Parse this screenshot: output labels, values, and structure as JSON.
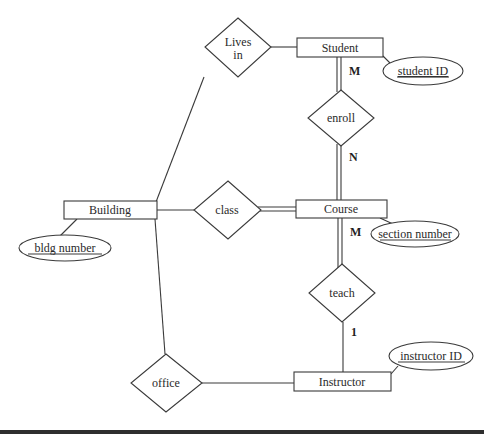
{
  "diagram": {
    "type": "ER diagram",
    "entities": [
      {
        "id": "student",
        "label": "Student"
      },
      {
        "id": "building",
        "label": "Building"
      },
      {
        "id": "course",
        "label": "Course"
      },
      {
        "id": "instructor",
        "label": "Instructor"
      }
    ],
    "relationships": [
      {
        "id": "lives_in",
        "label_line1": "Lives",
        "label_line2": "in"
      },
      {
        "id": "enroll",
        "label": "enroll"
      },
      {
        "id": "class",
        "label": "class"
      },
      {
        "id": "teach",
        "label": "teach"
      },
      {
        "id": "office",
        "label": "office"
      }
    ],
    "attributes": [
      {
        "id": "student_id",
        "label": "student ID",
        "key": true,
        "entity": "student"
      },
      {
        "id": "bldg_number",
        "label": "bldg number",
        "key": true,
        "entity": "building"
      },
      {
        "id": "section_number",
        "label": "section number",
        "key": true,
        "entity": "course"
      },
      {
        "id": "instructor_id",
        "label": "instructor ID",
        "key": true,
        "entity": "instructor"
      }
    ],
    "cardinalities": {
      "student_enroll": "M",
      "enroll_course": "N",
      "course_teach": "M",
      "teach_instructor": "1"
    },
    "connections": [
      {
        "from": "lives_in",
        "to": "student",
        "participation": "partial"
      },
      {
        "from": "lives_in",
        "to": "building",
        "participation": "partial"
      },
      {
        "from": "student",
        "to": "enroll",
        "participation": "total"
      },
      {
        "from": "enroll",
        "to": "course",
        "participation": "total"
      },
      {
        "from": "building",
        "to": "class",
        "participation": "partial"
      },
      {
        "from": "class",
        "to": "course",
        "participation": "total"
      },
      {
        "from": "course",
        "to": "teach",
        "participation": "total"
      },
      {
        "from": "teach",
        "to": "instructor",
        "participation": "partial"
      },
      {
        "from": "building",
        "to": "office",
        "participation": "partial"
      },
      {
        "from": "office",
        "to": "instructor",
        "participation": "partial"
      }
    ]
  }
}
